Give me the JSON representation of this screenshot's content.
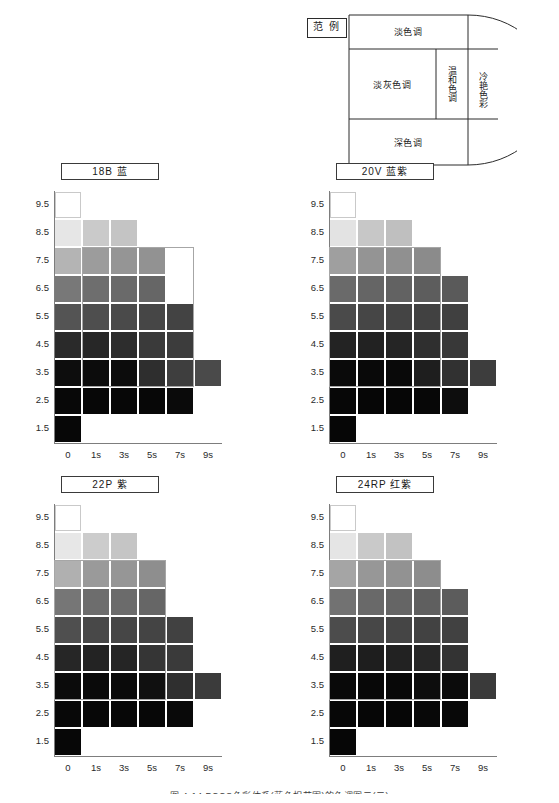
{
  "legend": {
    "tag": "范  例",
    "zones": {
      "light_tone": "淡色调",
      "light_gray_tone": "淡灰色调",
      "mild_tone": "温和色调",
      "cool_vivid": "冷艳色彩",
      "dark_tone": "深色调"
    }
  },
  "axes": {
    "y_ticks": [
      "9.5",
      "8.5",
      "7.5",
      "6.5",
      "5.5",
      "4.5",
      "3.5",
      "2.5",
      "1.5"
    ],
    "x_ticks": [
      "0",
      "1s",
      "3s",
      "5s",
      "7s",
      "9s"
    ]
  },
  "caption": "图 4-14  PCCS色彩体系(蓝色相范围)的色调图示(二)",
  "chart_data": [
    {
      "type": "heatmap",
      "title": "18B  蓝",
      "hue_code": "18B",
      "hue_name": "蓝",
      "xlabel": "",
      "ylabel": "",
      "categories": [
        "0",
        "1s",
        "3s",
        "5s",
        "7s",
        "9s"
      ],
      "rows": [
        "9.5",
        "8.5",
        "7.5",
        "6.5",
        "5.5",
        "4.5",
        "3.5",
        "2.5",
        "1.5"
      ],
      "values": [
        [
          "#ffffff",
          null,
          null,
          null,
          null,
          null
        ],
        [
          "#e6e6e6",
          "#cacaca",
          "#c4c4c4",
          null,
          null,
          null
        ],
        [
          "#b4b4b4",
          "#9c9c9c",
          "#959595",
          "#929292",
          null,
          null
        ],
        [
          "#787878",
          "#6e6e6e",
          "#6a6a6a",
          "#666666",
          null,
          null
        ],
        [
          "#545454",
          "#4e4e4e",
          "#4a4a4a",
          "#464646",
          "#434343",
          null
        ],
        [
          "#2a2a2a",
          "#272727",
          "#2d2d2d",
          "#3a3a3a",
          "#3c3c3c",
          null
        ],
        [
          "#0d0d0d",
          "#0c0c0c",
          "#0c0c0c",
          "#2e2e2e",
          "#3e3e3e",
          "#4a4a4a"
        ],
        [
          "#080808",
          "#070707",
          "#070707",
          "#070707",
          "#0a0a0a",
          null
        ],
        [
          "#070707",
          null,
          null,
          null,
          null,
          null
        ]
      ],
      "zone_outline": {
        "col_start": 1,
        "col_end": 4,
        "row_start": 2,
        "row_end": 6
      }
    },
    {
      "type": "heatmap",
      "title": "20V  蓝紫",
      "hue_code": "20V",
      "hue_name": "蓝紫",
      "xlabel": "",
      "ylabel": "",
      "categories": [
        "0",
        "1s",
        "3s",
        "5s",
        "7s",
        "9s"
      ],
      "rows": [
        "9.5",
        "8.5",
        "7.5",
        "6.5",
        "5.5",
        "4.5",
        "3.5",
        "2.5",
        "1.5"
      ],
      "values": [
        [
          "#ffffff",
          null,
          null,
          null,
          null,
          null
        ],
        [
          "#e3e3e3",
          "#c7c7c7",
          "#bfbfbf",
          null,
          null,
          null
        ],
        [
          "#9f9f9f",
          "#949494",
          "#909090",
          "#8b8b8b",
          null,
          null
        ],
        [
          "#6a6a6a",
          "#656565",
          "#626262",
          "#5d5d5d",
          "#5a5a5a",
          null
        ],
        [
          "#4a4a4a",
          "#464646",
          "#444444",
          "#414141",
          "#404040",
          null
        ],
        [
          "#232323",
          "#222222",
          "#252525",
          "#2f2f2f",
          "#383838",
          null
        ],
        [
          "#0a0a0a",
          "#090909",
          "#090909",
          "#1e1e1e",
          "#313131",
          "#3d3d3d"
        ],
        [
          "#070707",
          "#060606",
          "#060606",
          "#070707",
          "#0d0d0d",
          null
        ],
        [
          "#060606",
          null,
          null,
          null,
          null,
          null
        ]
      ],
      "zone_outline": {
        "col_start": 0,
        "col_end": 3,
        "row_start": 2,
        "row_end": 6
      }
    },
    {
      "type": "heatmap",
      "title": "22P  紫",
      "hue_code": "22P",
      "hue_name": "紫",
      "xlabel": "",
      "ylabel": "",
      "categories": [
        "0",
        "1s",
        "3s",
        "5s",
        "7s",
        "9s"
      ],
      "rows": [
        "9.5",
        "8.5",
        "7.5",
        "6.5",
        "5.5",
        "4.5",
        "3.5",
        "2.5",
        "1.5"
      ],
      "values": [
        [
          "#ffffff",
          null,
          null,
          null,
          null,
          null
        ],
        [
          "#e7e7e7",
          "#cccccc",
          "#c5c5c5",
          null,
          null,
          null
        ],
        [
          "#b0b0b0",
          "#9a9a9a",
          "#969696",
          "#8e8e8e",
          null,
          null
        ],
        [
          "#767676",
          "#6d6d6d",
          "#6b6b6b",
          "#666666",
          null,
          null
        ],
        [
          "#4f4f4f",
          "#484848",
          "#464646",
          "#444444",
          "#414141",
          null
        ],
        [
          "#262626",
          "#232323",
          "#252525",
          "#353535",
          "#3a3a3a",
          null
        ],
        [
          "#0b0b0b",
          "#0a0a0a",
          "#0a0a0a",
          "#101010",
          "#2f2f2f",
          "#3b3b3b"
        ],
        [
          "#080808",
          "#070707",
          "#070707",
          "#070707",
          "#090909",
          null
        ],
        [
          "#070707",
          null,
          null,
          null,
          null,
          null
        ]
      ],
      "zone_outline": {
        "col_start": 0,
        "col_end": 3,
        "row_start": 2,
        "row_end": 6
      }
    },
    {
      "type": "heatmap",
      "title": "24RP  红紫",
      "hue_code": "24RP",
      "hue_name": "红紫",
      "xlabel": "",
      "ylabel": "",
      "categories": [
        "0",
        "1s",
        "3s",
        "5s",
        "7s",
        "9s"
      ],
      "rows": [
        "9.5",
        "8.5",
        "7.5",
        "6.5",
        "5.5",
        "4.5",
        "3.5",
        "2.5",
        "1.5"
      ],
      "values": [
        [
          "#ffffff",
          null,
          null,
          null,
          null,
          null
        ],
        [
          "#e5e5e5",
          "#c9c9c9",
          "#c2c2c2",
          null,
          null,
          null
        ],
        [
          "#a5a5a5",
          "#979797",
          "#929292",
          "#8d8d8d",
          null,
          null
        ],
        [
          "#727272",
          "#696969",
          "#656565",
          "#5f5f5f",
          "#5c5c5c",
          null
        ],
        [
          "#4c4c4c",
          "#474747",
          "#454545",
          "#424242",
          "#414141",
          null
        ],
        [
          "#1f1f1f",
          "#1e1e1e",
          "#222222",
          "#272727",
          "#333333",
          null
        ],
        [
          "#090909",
          "#080808",
          "#080808",
          "#0d0d0d",
          "#0b0b0b",
          "#3a3a3a"
        ],
        [
          "#070707",
          "#060606",
          "#060606",
          "#080808",
          "#080808",
          null
        ],
        [
          "#060606",
          null,
          null,
          null,
          null,
          null
        ]
      ],
      "zone_outline": {
        "col_start": 0,
        "col_end": 3,
        "row_start": 2,
        "row_end": 6
      }
    }
  ]
}
